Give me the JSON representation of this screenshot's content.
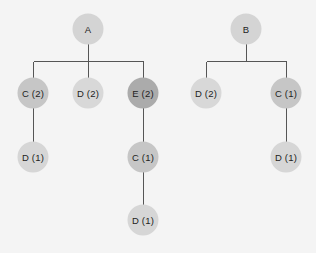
{
  "diagram": {
    "type": "tree",
    "edge_color": "#555555",
    "trees": [
      {
        "root": "A",
        "nodes": [
          {
            "id": "A",
            "label": "A",
            "x": 88,
            "y": 29,
            "color": "#d4d4d4"
          },
          {
            "id": "A-C",
            "label": "C (2)",
            "x": 33,
            "y": 93,
            "color": "#c6c6c6"
          },
          {
            "id": "A-D",
            "label": "D (2)",
            "x": 88,
            "y": 93,
            "color": "#d8d8d8"
          },
          {
            "id": "A-E",
            "label": "E (2)",
            "x": 143,
            "y": 93,
            "color": "#ababab"
          },
          {
            "id": "A-C-D",
            "label": "D (1)",
            "x": 33,
            "y": 157,
            "color": "#d6d6d6"
          },
          {
            "id": "A-E-C",
            "label": "C (1)",
            "x": 143,
            "y": 157,
            "color": "#c6c6c6"
          },
          {
            "id": "A-E-C-D",
            "label": "D (1)",
            "x": 143,
            "y": 220,
            "color": "#d6d6d6"
          }
        ],
        "edges": [
          [
            "A",
            "A-C"
          ],
          [
            "A",
            "A-D"
          ],
          [
            "A",
            "A-E"
          ],
          [
            "A-C",
            "A-C-D"
          ],
          [
            "A-E",
            "A-E-C"
          ],
          [
            "A-E-C",
            "A-E-C-D"
          ]
        ]
      },
      {
        "root": "B",
        "nodes": [
          {
            "id": "B",
            "label": "B",
            "x": 246,
            "y": 29,
            "color": "#d4d4d4"
          },
          {
            "id": "B-D",
            "label": "D (2)",
            "x": 206,
            "y": 93,
            "color": "#d8d8d8"
          },
          {
            "id": "B-C",
            "label": "C (1)",
            "x": 286,
            "y": 93,
            "color": "#c6c6c6"
          },
          {
            "id": "B-C-D",
            "label": "D (1)",
            "x": 286,
            "y": 157,
            "color": "#d6d6d6"
          }
        ],
        "edges": [
          [
            "B",
            "B-D"
          ],
          [
            "B",
            "B-C"
          ],
          [
            "B-C",
            "B-C-D"
          ]
        ]
      }
    ]
  },
  "labels": {
    "tree_a": {
      "root": "A",
      "c2": "C (2)",
      "d2": "D (2)",
      "e2": "E (2)",
      "c2_d1": "D (1)",
      "e2_c1": "C (1)",
      "e2_c1_d1": "D (1)"
    },
    "tree_b": {
      "root": "B",
      "d2": "D (2)",
      "c1": "C (1)",
      "c1_d1": "D (1)"
    }
  }
}
